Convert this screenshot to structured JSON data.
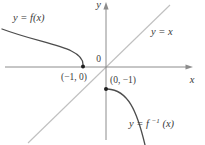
{
  "figure": {
    "background": "#ffffff",
    "colors": {
      "axis": "#8c8c8c",
      "identity_line": "#c0c0c0",
      "curve": "#4d4d4d",
      "point": "#1f1f1f",
      "text": "#3a3a3a"
    },
    "labels": {
      "y_axis": "y",
      "x_axis": "x",
      "origin": "0",
      "f_curve": "y = f(x)",
      "identity_line": "y = x",
      "f_inverse_prefix": "y = f",
      "f_inverse_sup": "−1",
      "f_inverse_suffix": "(x)",
      "point_on_f": "(−1, 0)",
      "point_on_f_inverse": "(0, −1)"
    }
  }
}
